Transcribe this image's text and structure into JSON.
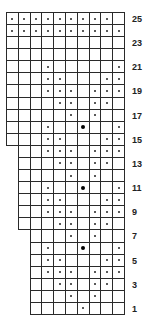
{
  "chart": {
    "total_rows": 25,
    "max_columns": 10,
    "row_labels": [
      "1",
      "3",
      "5",
      "7",
      "9",
      "11",
      "13",
      "15",
      "17",
      "19",
      "21",
      "23",
      "25"
    ],
    "legend": {
      "empty": "knit",
      "dot": "purl",
      "big_dot": "bobble"
    },
    "rows": [
      {
        "row": 1,
        "first_col": 3,
        "dots": [
          7
        ],
        "big": []
      },
      {
        "row": 2,
        "first_col": 3,
        "dots": [
          6,
          8
        ],
        "big": []
      },
      {
        "row": 3,
        "first_col": 3,
        "dots": [
          5,
          6,
          8,
          9
        ],
        "big": []
      },
      {
        "row": 4,
        "first_col": 3,
        "dots": [
          4,
          5,
          6,
          8,
          9,
          10
        ],
        "big": []
      },
      {
        "row": 5,
        "first_col": 3,
        "dots": [
          4,
          5,
          9,
          10
        ],
        "big": []
      },
      {
        "row": 6,
        "first_col": 3,
        "dots": [
          4,
          10
        ],
        "big": [
          7
        ]
      },
      {
        "row": 7,
        "first_col": 3,
        "dots": [
          6,
          8
        ],
        "big": []
      },
      {
        "row": 8,
        "first_col": 2,
        "dots": [
          5,
          6,
          8,
          9
        ],
        "big": []
      },
      {
        "row": 9,
        "first_col": 2,
        "dots": [
          4,
          5,
          6,
          8,
          9,
          10
        ],
        "big": []
      },
      {
        "row": 10,
        "first_col": 2,
        "dots": [
          4,
          5,
          9,
          10
        ],
        "big": []
      },
      {
        "row": 11,
        "first_col": 2,
        "dots": [
          4,
          10
        ],
        "big": [
          7
        ]
      },
      {
        "row": 12,
        "first_col": 2,
        "dots": [
          6,
          8
        ],
        "big": []
      },
      {
        "row": 13,
        "first_col": 2,
        "dots": [
          5,
          6,
          8,
          9
        ],
        "big": []
      },
      {
        "row": 14,
        "first_col": 2,
        "dots": [
          4,
          5,
          6,
          8,
          9,
          10
        ],
        "big": []
      },
      {
        "row": 15,
        "first_col": 1,
        "dots": [
          4,
          5,
          9,
          10
        ],
        "big": []
      },
      {
        "row": 16,
        "first_col": 1,
        "dots": [
          4,
          10
        ],
        "big": [
          7
        ]
      },
      {
        "row": 17,
        "first_col": 1,
        "dots": [
          6,
          8
        ],
        "big": []
      },
      {
        "row": 18,
        "first_col": 1,
        "dots": [
          5,
          6,
          8,
          9
        ],
        "big": []
      },
      {
        "row": 19,
        "first_col": 1,
        "dots": [
          4,
          5,
          6,
          8,
          9,
          10
        ],
        "big": []
      },
      {
        "row": 20,
        "first_col": 1,
        "dots": [
          4,
          5,
          9,
          10
        ],
        "big": []
      },
      {
        "row": 21,
        "first_col": 1,
        "dots": [
          4,
          10
        ],
        "big": []
      },
      {
        "row": 22,
        "first_col": 1,
        "dots": [],
        "big": []
      },
      {
        "row": 23,
        "first_col": 1,
        "dots": [],
        "big": []
      },
      {
        "row": 24,
        "first_col": 1,
        "dots": [
          1,
          2,
          3,
          4,
          5,
          6,
          7,
          8,
          9,
          10
        ],
        "big": []
      },
      {
        "row": 25,
        "first_col": 1,
        "dots": [
          1,
          2,
          3,
          4,
          5,
          6,
          7,
          8,
          9
        ],
        "big": []
      }
    ]
  }
}
